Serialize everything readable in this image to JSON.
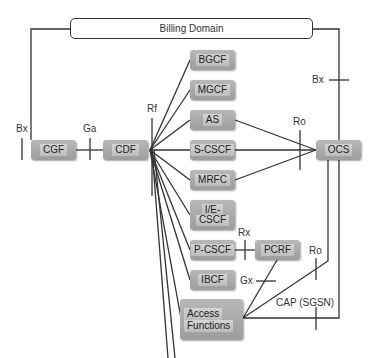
{
  "title": "Billing Domain",
  "nodes": {
    "cgf": "CGF",
    "cdf": "CDF",
    "bgcf": "BGCF",
    "mgcf": "MGCF",
    "as": "AS",
    "scscf": "S-CSCF",
    "mrfc": "MRFC",
    "iecscf_line1": "I/E-",
    "iecscf_line2": "CSCF",
    "pcscf": "P-CSCF",
    "pcrf": "PCRF",
    "ibcf": "IBCF",
    "access_line1": "Access",
    "access_line2": "Functions",
    "ocs": "OCS"
  },
  "interfaces": {
    "bx_left": "Bx",
    "ga": "Ga",
    "rf": "Rf",
    "bx_right": "Bx",
    "ro_top": "Ro",
    "rx": "Rx",
    "gx": "Gx",
    "ro_bottom": "Ro",
    "cap": "CAP (SGSN)"
  },
  "colors": {
    "line": "#333333",
    "node_fill": "#aaaaaa",
    "background": "#ffffff"
  }
}
